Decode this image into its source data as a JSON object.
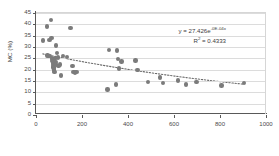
{
  "chart_data": {
    "type": "scatter",
    "title": "",
    "xlabel": "electrical resitivity (Ω.m)",
    "ylabel": "MC (%)",
    "xlim": [
      0,
      1000
    ],
    "ylim": [
      0,
      45
    ],
    "xticks": [
      0,
      200,
      400,
      600,
      800,
      1000
    ],
    "yticks": [
      0,
      5,
      10,
      15,
      20,
      25,
      30,
      35,
      40,
      45
    ],
    "grid": "horizontal",
    "legend": "none",
    "marker_color": "#7b7b7b",
    "trendline": {
      "type": "exponential",
      "style": "dotted",
      "color": "#6b6b6b",
      "equation": "y = 27.426e",
      "equation_exponent": "-0E-04x",
      "r_squared_label": "R",
      "r_squared_sup": "2",
      "r_squared_value": " = 0.4333",
      "coefficient": 27.426,
      "rate": -0.0008,
      "r2": 0.4333
    },
    "points": [
      {
        "x": 30,
        "y": 32.8
      },
      {
        "x": 48,
        "y": 39.1
      },
      {
        "x": 50,
        "y": 26.3
      },
      {
        "x": 55,
        "y": 25.9
      },
      {
        "x": 58,
        "y": 33.2
      },
      {
        "x": 62,
        "y": 26.1
      },
      {
        "x": 66,
        "y": 41.9
      },
      {
        "x": 68,
        "y": 33.9
      },
      {
        "x": 70,
        "y": 25.2
      },
      {
        "x": 71,
        "y": 24.6
      },
      {
        "x": 72,
        "y": 23.8
      },
      {
        "x": 73,
        "y": 23.0
      },
      {
        "x": 74,
        "y": 22.4
      },
      {
        "x": 75,
        "y": 21.6
      },
      {
        "x": 76,
        "y": 21.0
      },
      {
        "x": 78,
        "y": 20.3
      },
      {
        "x": 79,
        "y": 19.6
      },
      {
        "x": 80,
        "y": 18.9
      },
      {
        "x": 82,
        "y": 24.9
      },
      {
        "x": 84,
        "y": 23.4
      },
      {
        "x": 86,
        "y": 22.2
      },
      {
        "x": 88,
        "y": 30.6
      },
      {
        "x": 92,
        "y": 27.4
      },
      {
        "x": 96,
        "y": 25.4
      },
      {
        "x": 98,
        "y": 21.5
      },
      {
        "x": 104,
        "y": 22.2
      },
      {
        "x": 108,
        "y": 17.4
      },
      {
        "x": 118,
        "y": 26.1
      },
      {
        "x": 136,
        "y": 25.6
      },
      {
        "x": 150,
        "y": 38.5
      },
      {
        "x": 158,
        "y": 21.6
      },
      {
        "x": 163,
        "y": 19.0
      },
      {
        "x": 170,
        "y": 18.8
      },
      {
        "x": 176,
        "y": 19.0
      },
      {
        "x": 310,
        "y": 11.3
      },
      {
        "x": 318,
        "y": 28.6
      },
      {
        "x": 348,
        "y": 13.5
      },
      {
        "x": 352,
        "y": 28.5
      },
      {
        "x": 356,
        "y": 24.6
      },
      {
        "x": 362,
        "y": 20.6
      },
      {
        "x": 372,
        "y": 23.6
      },
      {
        "x": 432,
        "y": 24.1
      },
      {
        "x": 442,
        "y": 19.8
      },
      {
        "x": 488,
        "y": 14.6
      },
      {
        "x": 540,
        "y": 16.6
      },
      {
        "x": 552,
        "y": 14.2
      },
      {
        "x": 618,
        "y": 15.2
      },
      {
        "x": 652,
        "y": 13.5
      },
      {
        "x": 698,
        "y": 14.6
      },
      {
        "x": 806,
        "y": 13.1
      },
      {
        "x": 904,
        "y": 14.1
      }
    ]
  }
}
